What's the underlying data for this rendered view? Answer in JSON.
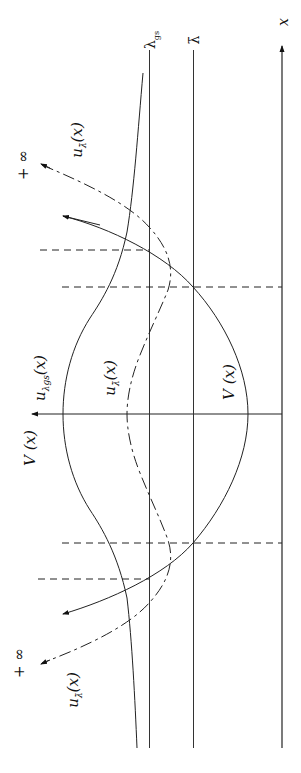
{
  "diagram": {
    "orientation": "rotated 90deg counter-clockwise",
    "axes": {
      "x_axis_label": "x",
      "v_axis_label": "V (x)"
    },
    "levels": [
      {
        "id": "lambda_gs",
        "label": "λ",
        "subscript": "gs"
      },
      {
        "id": "lambda_bar",
        "label": "λ̄"
      }
    ],
    "curves": [
      {
        "id": "potential",
        "label": "V (x)",
        "style": "solid"
      },
      {
        "id": "u_lambda_gs",
        "label": "u",
        "subscript": "λgs",
        "arg": "(x)",
        "style": "solid"
      },
      {
        "id": "u_lambda_bar",
        "label": "u",
        "subscript": "λ̄",
        "arg": "(x)",
        "style": "dash-dot"
      }
    ],
    "asymptote_labels": {
      "top": "+ ∞",
      "bottom": "+ ∞"
    },
    "tail_labels": {
      "top": "u",
      "top_sub": "λ̄",
      "top_arg": "(x)",
      "bottom": "u",
      "bottom_sub": "λ̄",
      "bottom_arg": "(x)"
    },
    "turning_point_markers": "dashed"
  }
}
